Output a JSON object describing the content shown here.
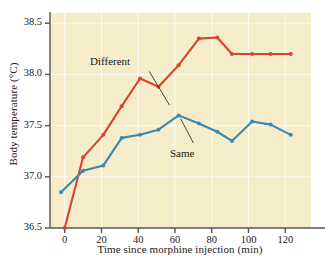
{
  "chart_data": {
    "type": "line",
    "title": "",
    "xlabel": "Time since morphine injection (min)",
    "ylabel": "Body temperature (°C)",
    "xlim": [
      -8,
      134
    ],
    "ylim": [
      36.5,
      38.6
    ],
    "xticks": [
      0,
      20,
      40,
      60,
      80,
      100,
      120
    ],
    "yticks": [
      36.5,
      37.0,
      37.5,
      38.0,
      38.5
    ],
    "ytick_labels": [
      "36.5",
      "37.0",
      "37.5",
      "38.0",
      "38.5"
    ],
    "xtick_labels": [
      "0",
      "20",
      "40",
      "60",
      "80",
      "100",
      "120"
    ],
    "grid": true,
    "legend": "inline-annotations",
    "plot_background": "#f5edc9",
    "series": [
      {
        "name": "Different",
        "color": "#d6442f",
        "x": [
          0,
          10,
          21,
          31,
          41,
          51,
          62,
          73,
          83,
          91,
          102,
          112,
          123
        ],
        "values": [
          36.5,
          37.19,
          37.41,
          37.69,
          37.96,
          37.88,
          38.09,
          38.35,
          38.36,
          38.2,
          38.2,
          38.2,
          38.2
        ],
        "label_position": {
          "x": 29,
          "y": 38.12
        }
      },
      {
        "name": "Same",
        "color": "#3b87b0",
        "x": [
          -2,
          10,
          21,
          31,
          41,
          51,
          62,
          73,
          83,
          91,
          102,
          112,
          123
        ],
        "values": [
          36.85,
          37.06,
          37.11,
          37.38,
          37.41,
          37.46,
          37.6,
          37.52,
          37.44,
          37.35,
          37.54,
          37.51,
          37.41
        ],
        "label_position": {
          "x": 66,
          "y": 37.22
        }
      }
    ],
    "annotations": [
      {
        "text": "Different",
        "series": "Different",
        "leader_from": [
          46,
          38.03
        ],
        "leader_to": [
          57,
          37.7
        ]
      },
      {
        "text": "Same",
        "series": "Same",
        "leader_from": [
          70,
          37.33
        ],
        "leader_to": [
          63,
          37.57
        ]
      }
    ]
  }
}
